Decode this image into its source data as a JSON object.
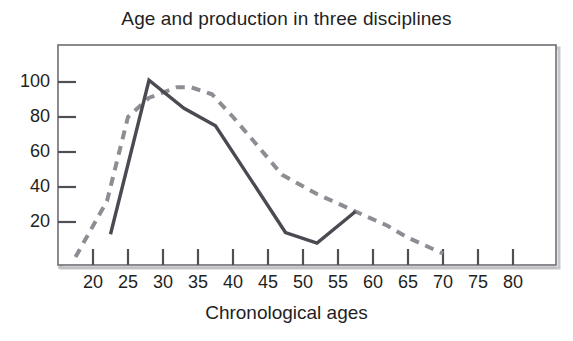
{
  "chart_data": {
    "type": "line",
    "title": "Age and production in three disciplines",
    "xlabel": "Chronological ages",
    "ylabel": "",
    "xlim": [
      16,
      82
    ],
    "ylim": [
      0,
      112
    ],
    "grid": false,
    "legend": "none",
    "xticks": [
      20,
      25,
      30,
      35,
      40,
      45,
      50,
      55,
      60,
      65,
      70,
      75,
      80
    ],
    "yticks": [
      20,
      40,
      60,
      80,
      100
    ],
    "series": [
      {
        "name": "solid-series",
        "style": "solid",
        "color": "#4a4a52",
        "x": [
          22.5,
          28.0,
          33.0,
          37.5,
          47.5,
          52.0,
          57.5
        ],
        "y": [
          13,
          101,
          85,
          75,
          14,
          8,
          26
        ]
      },
      {
        "name": "dashed-series",
        "style": "dashed",
        "color": "#8d8d94",
        "x": [
          17.5,
          22.0,
          25.0,
          28.0,
          32.0,
          34.0,
          37.0,
          40.0,
          43.0,
          47.0,
          52.0,
          57.5,
          62.0,
          65.0,
          70.0
        ],
        "y": [
          0,
          32,
          80,
          91,
          97,
          97,
          93,
          80,
          66,
          47,
          36,
          26,
          18,
          11,
          2
        ]
      }
    ],
    "annotations": []
  },
  "axis": {
    "ytick_labels": [
      "100",
      "80",
      "60",
      "40",
      "20"
    ],
    "xtick_labels": [
      "20",
      "25",
      "30",
      "35",
      "40",
      "45",
      "50",
      "55",
      "60",
      "65",
      "70",
      "75",
      "80"
    ]
  },
  "colors": {
    "frame": "#6d6d73",
    "solid_line": "#4a4a52",
    "dashed_line": "#8d8d94",
    "text": "#1f1f24",
    "background": "#ffffff"
  }
}
